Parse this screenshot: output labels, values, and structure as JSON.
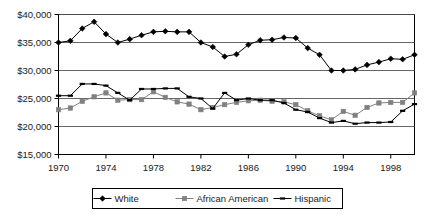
{
  "chart_data": {
    "type": "line",
    "title": "",
    "subtitle": "",
    "xlabel": "",
    "ylabel": "",
    "xlim": [
      1970,
      2000
    ],
    "ylim": [
      15000,
      40000
    ],
    "grid": true,
    "legend_position": "bottom",
    "x": [
      1970,
      1971,
      1972,
      1973,
      1974,
      1975,
      1976,
      1977,
      1978,
      1979,
      1980,
      1981,
      1982,
      1983,
      1984,
      1985,
      1986,
      1987,
      1988,
      1989,
      1990,
      1991,
      1992,
      1993,
      1994,
      1995,
      1996,
      1997,
      1998,
      1999,
      2000
    ],
    "x_tick_labels": [
      "1970",
      "1974",
      "1978",
      "1982",
      "1986",
      "1990",
      "1994",
      "1998"
    ],
    "x_tick_values": [
      1970,
      1974,
      1978,
      1982,
      1986,
      1990,
      1994,
      1998
    ],
    "y_tick_labels": [
      "$15,000",
      "$20,000",
      "$25,000",
      "$30,000",
      "$35,000",
      "$40,000"
    ],
    "y_tick_values": [
      15000,
      20000,
      25000,
      30000,
      35000,
      40000
    ],
    "series": [
      {
        "name": "White",
        "marker": "diamond",
        "color": "#000000",
        "values": [
          35000,
          35300,
          37500,
          38700,
          36500,
          35000,
          35600,
          36300,
          36900,
          37000,
          36900,
          36900,
          35000,
          34200,
          32500,
          32900,
          34600,
          35400,
          35500,
          35900,
          35800,
          34000,
          32800,
          30000,
          30000,
          30200,
          31000,
          31500,
          32100,
          32000,
          32800
        ]
      },
      {
        "name": "African American",
        "marker": "square",
        "color": "#808080",
        "values": [
          23000,
          23300,
          24500,
          25300,
          26000,
          24700,
          24800,
          24800,
          26200,
          25200,
          24400,
          24000,
          23000,
          23400,
          23900,
          24300,
          24600,
          24700,
          24500,
          24400,
          23900,
          22800,
          21900,
          21200,
          22700,
          22000,
          23400,
          24200,
          24300,
          24300,
          26000
        ]
      },
      {
        "name": "Hispanic",
        "marker": "dash",
        "color": "#000000",
        "values": [
          25500,
          25500,
          27600,
          27600,
          27300,
          26000,
          24700,
          26700,
          26700,
          26800,
          26800,
          25300,
          25000,
          23200,
          26000,
          24700,
          25000,
          24700,
          24700,
          24200,
          23000,
          22600,
          21500,
          20700,
          21000,
          20500,
          20700,
          20700,
          20800,
          22800,
          24000
        ]
      }
    ]
  },
  "legend": {
    "entries": [
      {
        "label": "White"
      },
      {
        "label": "African American"
      },
      {
        "label": "Hispanic"
      }
    ]
  }
}
